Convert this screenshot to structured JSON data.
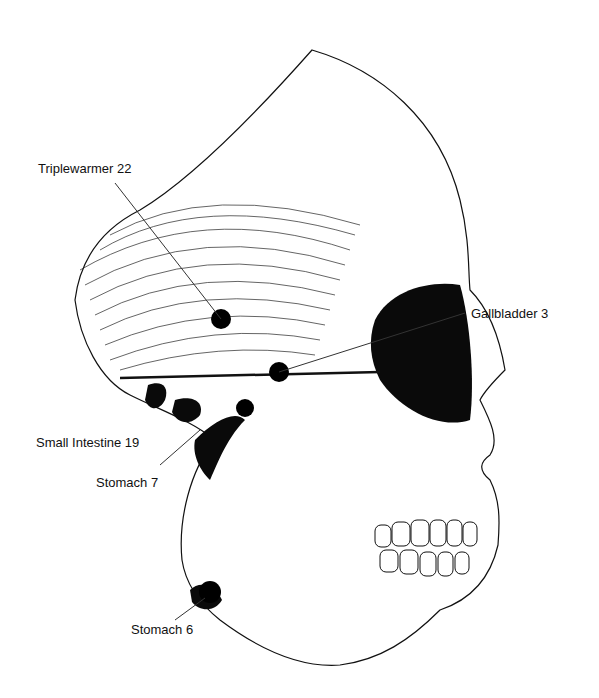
{
  "diagram": {
    "labels": [
      {
        "id": "tw22",
        "text": "Triplewarmer 22"
      },
      {
        "id": "gb3",
        "text": "Gallbladder 3"
      },
      {
        "id": "si19",
        "text": "Small Intestine 19"
      },
      {
        "id": "st7",
        "text": "Stomach 7"
      },
      {
        "id": "st6",
        "text": "Stomach 6"
      }
    ]
  }
}
